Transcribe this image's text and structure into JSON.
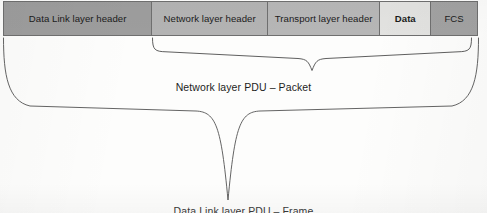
{
  "figure": {
    "type": "encapsulation-diagram"
  },
  "frame": {
    "cells": [
      {
        "label": "Data Link layer header",
        "fill": "#9d9d9d",
        "bold": false
      },
      {
        "label": "Network layer header",
        "fill": "#b3b3b3",
        "bold": false
      },
      {
        "label": "Transport layer header",
        "fill": "#b6b6b6",
        "bold": false
      },
      {
        "label": "Data",
        "fill": "#e2e2e0",
        "bold": true
      },
      {
        "label": "FCS",
        "fill": "#a2a2a2",
        "bold": false
      }
    ]
  },
  "braces": [
    {
      "name": "network-layer-pdu-brace",
      "label": "Network layer PDU – Packet",
      "spans": [
        "Network layer header",
        "Transport layer header",
        "Data",
        "FCS"
      ]
    },
    {
      "name": "data-link-layer-pdu-brace",
      "label": "Data Link layer PDU – Frame",
      "spans": [
        "Data Link layer header",
        "Network layer header",
        "Transport layer header",
        "Data",
        "FCS"
      ]
    }
  ],
  "colors": {
    "border": "#6f6f6f",
    "brace_stroke": "#4d4d4d",
    "text": "#1b1b1b",
    "page_background": "#fdfdfc"
  }
}
